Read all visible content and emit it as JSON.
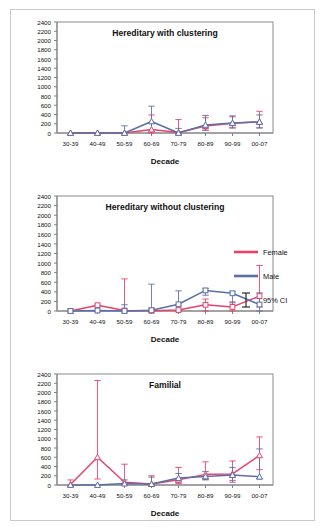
{
  "figure": {
    "axis_title_x": "Decade",
    "categories": [
      "30-39",
      "40-49",
      "50-59",
      "60-69",
      "70-79",
      "80-89",
      "90-99",
      "00-07"
    ],
    "y_ticks": [
      0,
      200,
      400,
      600,
      800,
      1000,
      1200,
      1400,
      1600,
      1800,
      2000,
      2200,
      2400
    ],
    "colors": {
      "female": "#e8416b",
      "male": "#5b6fa8",
      "ci": "#2a2a2a",
      "axis": "#808080",
      "frame": "#c9c9c9",
      "text": "#111111"
    }
  },
  "legend": {
    "items": [
      {
        "label": "Female",
        "type": "line",
        "color": "#e8416b"
      },
      {
        "label": "Male",
        "type": "line",
        "color": "#5b6fa8"
      },
      {
        "label": "95% CI",
        "type": "errorbar",
        "color": "#2a2a2a"
      }
    ]
  },
  "chart_data": [
    {
      "type": "line",
      "title": "Hereditary with clustering",
      "xlabel": "Decade",
      "ylabel": "",
      "ylim": [
        0,
        2400
      ],
      "ytick_step": 200,
      "grid": false,
      "categories": [
        "30-39",
        "40-49",
        "50-59",
        "60-69",
        "70-79",
        "80-89",
        "90-99",
        "00-07"
      ],
      "series": [
        {
          "name": "Female",
          "color": "#e8416b",
          "marker": "triangle",
          "values": [
            0,
            0,
            0,
            75,
            10,
            150,
            210,
            240
          ],
          "ci_lower": [
            0,
            0,
            0,
            0,
            0,
            60,
            110,
            110
          ],
          "ci_upper": [
            0,
            0,
            0,
            390,
            290,
            330,
            350,
            470
          ]
        },
        {
          "name": "Male",
          "color": "#5b6fa8",
          "marker": "triangle",
          "values": [
            0,
            0,
            0,
            250,
            0,
            175,
            215,
            240
          ],
          "ci_lower": [
            0,
            0,
            0,
            40,
            0,
            60,
            110,
            110
          ],
          "ci_upper": [
            0,
            0,
            155,
            580,
            100,
            380,
            370,
            390
          ]
        }
      ]
    },
    {
      "type": "line",
      "title": "Hereditary without clustering",
      "xlabel": "Decade",
      "ylabel": "",
      "ylim": [
        0,
        2400
      ],
      "ytick_step": 200,
      "grid": false,
      "categories": [
        "30-39",
        "40-49",
        "50-59",
        "60-69",
        "70-79",
        "80-89",
        "90-99",
        "00-07"
      ],
      "series": [
        {
          "name": "Female",
          "color": "#e8416b",
          "marker": "square",
          "values": [
            0,
            120,
            10,
            5,
            20,
            130,
            85,
            310
          ],
          "ci_lower": [
            0,
            0,
            0,
            0,
            0,
            0,
            0,
            85
          ],
          "ci_upper": [
            0,
            120,
            670,
            60,
            120,
            250,
            190,
            950
          ]
        },
        {
          "name": "Male",
          "color": "#5b6fa8",
          "marker": "square",
          "values": [
            0,
            10,
            0,
            15,
            140,
            430,
            370,
            135
          ],
          "ci_lower": [
            0,
            0,
            0,
            0,
            0,
            330,
            170,
            0
          ],
          "ci_upper": [
            0,
            10,
            130,
            560,
            420,
            470,
            410,
            380
          ]
        }
      ]
    },
    {
      "type": "line",
      "title": "Familial",
      "xlabel": "Decade",
      "ylabel": "",
      "ylim": [
        0,
        2400
      ],
      "ytick_step": 200,
      "grid": false,
      "categories": [
        "30-39",
        "40-49",
        "50-59",
        "60-69",
        "70-79",
        "80-89",
        "90-99",
        "00-07"
      ],
      "series": [
        {
          "name": "Female",
          "color": "#e8416b",
          "marker": "triangle",
          "values": [
            10,
            600,
            60,
            20,
            115,
            230,
            240,
            640
          ],
          "ci_lower": [
            0,
            130,
            0,
            0,
            30,
            120,
            100,
            330
          ],
          "ci_upper": [
            110,
            2260,
            450,
            200,
            380,
            500,
            520,
            1040
          ]
        },
        {
          "name": "Male",
          "color": "#5b6fa8",
          "marker": "triangle",
          "values": [
            0,
            0,
            30,
            20,
            150,
            185,
            215,
            180
          ],
          "ci_lower": [
            0,
            0,
            0,
            0,
            60,
            110,
            60,
            130
          ],
          "ci_upper": [
            0,
            0,
            110,
            170,
            250,
            290,
            380,
            780
          ]
        }
      ]
    }
  ]
}
